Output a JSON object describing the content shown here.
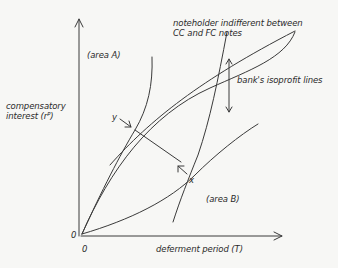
{
  "diagram": {
    "y_axis_label_line1": "compensatory",
    "y_axis_label_line2": "interest (rᴾ)",
    "x_axis_label": "deferment period (T)",
    "origin_y": "0",
    "origin_x": "0",
    "area_a": "(area A)",
    "area_b": "(area B)",
    "indifference_label_line1": "noteholder indifferent between",
    "indifference_label_line2": "CC and FC notes",
    "isoprofit_label": "bank's isoprofit lines",
    "point_y": "y",
    "point_x": "x",
    "line_color": "#3a3a3a",
    "background": "#f7f7f5"
  }
}
